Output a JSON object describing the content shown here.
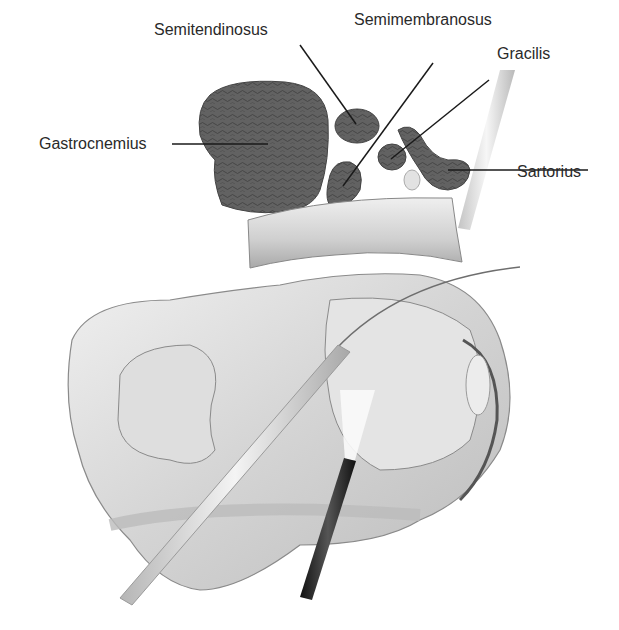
{
  "figure": {
    "labels": {
      "semitendinosus": "Semitendinosus",
      "semimembranosus": "Semimembranosus",
      "gracilis": "Gracilis",
      "gastrocnemius": "Gastrocnemius",
      "sartorius": "Sartorius"
    },
    "colors": {
      "muscle": "#5e5e5e",
      "muscle_texture": "#3c3c3c",
      "bone": "#d9d9d9",
      "bone_shade": "#bdbdbd",
      "outline": "#8a8a8a",
      "instrument_dark": "#1f1f1f",
      "leader_line": "#1a1a1a",
      "text": "#2a2a2a"
    }
  }
}
